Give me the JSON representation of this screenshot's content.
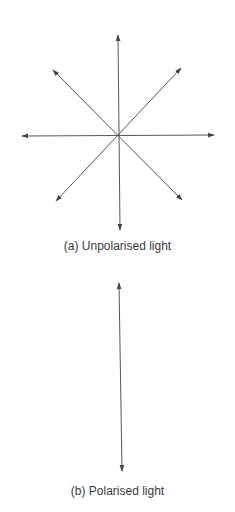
{
  "diagrams": [
    {
      "id": "a",
      "caption": "(a) Unpolarised light",
      "center": [
        118,
        135
      ],
      "arrow_tips": [
        [
          118,
          33
        ],
        [
          120,
          232
        ],
        [
          20,
          136
        ],
        [
          216,
          135
        ],
        [
          51,
          68
        ],
        [
          183,
          66
        ],
        [
          54,
          203
        ],
        [
          184,
          202
        ]
      ]
    },
    {
      "id": "b",
      "caption": "(b) Polarised light",
      "arrow_ends": [
        [
          119,
          281
        ],
        [
          122,
          473
        ]
      ]
    }
  ],
  "colors": {
    "line": "#444444",
    "text": "#3a3a3a"
  }
}
